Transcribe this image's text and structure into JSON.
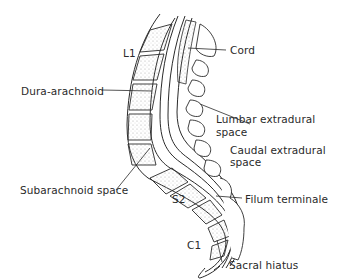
{
  "diagram": {
    "labels": {
      "l1": "L1",
      "cord": "Cord",
      "dura_arachnoid": "Dura-arachnoid",
      "lumbar_extradural_1": "Lumbar extradural",
      "lumbar_extradural_2": "space",
      "caudal_extradural_1": "Caudal extradural",
      "caudal_extradural_2": "space",
      "subarachnoid_space": "Subarachnoid space",
      "s2": "S2",
      "filum_terminale": "Filum terminale",
      "c1": "C1",
      "sacral_hiatus": "Sacral hiatus"
    },
    "colors": {
      "line": "#2a2a2a",
      "stipple": "#9a9a9a",
      "background": "#ffffff"
    }
  }
}
